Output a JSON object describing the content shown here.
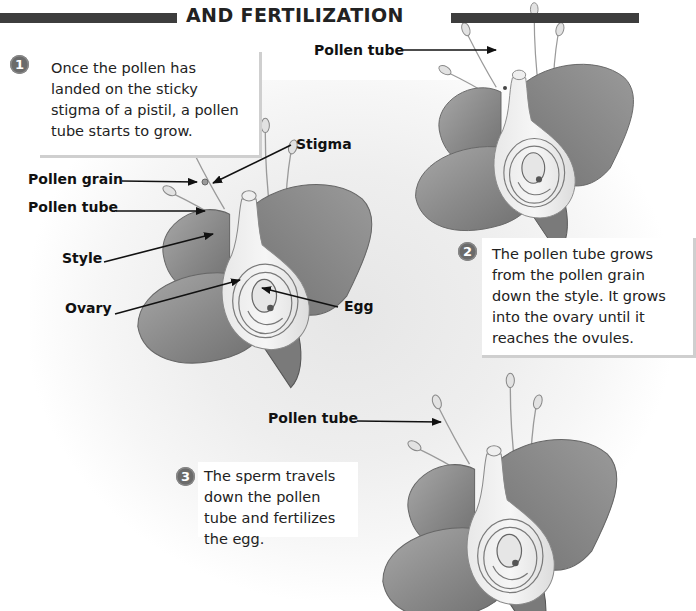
{
  "header": {
    "title": "AND FERTILIZATION"
  },
  "steps": [
    {
      "number": "1",
      "text": "Once the pollen has landed on the sticky stigma of a pistil, a pollen tube starts to grow."
    },
    {
      "number": "2",
      "text": "The pollen tube grows from the pollen grain down the style. It grows into the ovary until it reaches the ovules."
    },
    {
      "number": "3",
      "text": "The sperm travels down the pollen tube and fertilizes the egg."
    }
  ],
  "diagram1": {
    "labels": {
      "stigma": "Stigma",
      "pollen_grain": "Pollen grain",
      "pollen_tube": "Pollen tube",
      "style": "Style",
      "ovary": "Ovary",
      "egg": "Egg"
    }
  },
  "diagram2": {
    "labels": {
      "pollen_tube": "Pollen tube"
    }
  },
  "diagram3": {
    "labels": {
      "pollen_tube": "Pollen tube"
    }
  },
  "colors": {
    "header_bar": "#3d3d3d",
    "badge": "#6b6b6b",
    "petal": "#8a8a8a",
    "text": "#222222"
  }
}
